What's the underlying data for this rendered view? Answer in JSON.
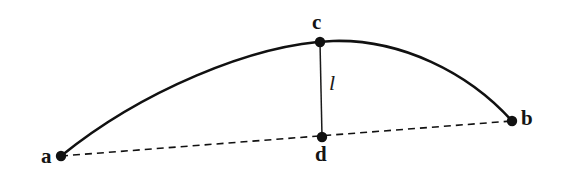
{
  "figure": {
    "background_color": "#ffffff",
    "stroke_color": "#111111",
    "arc_stroke_width": 2.6,
    "chord_stroke_width": 1.6,
    "sagitta_stroke_width": 1.5,
    "chord_dash_pattern": "7 5",
    "point_radius": 5.2
  },
  "points": [
    {
      "id": "a",
      "label": "a",
      "x": 61,
      "y": 156,
      "kind": "arc-endpoint"
    },
    {
      "id": "b",
      "label": "b",
      "x": 512,
      "y": 121,
      "kind": "arc-endpoint"
    },
    {
      "id": "c",
      "label": "c",
      "x": 320,
      "y": 42,
      "kind": "arc-apex"
    },
    {
      "id": "d",
      "label": "d",
      "x": 322,
      "y": 137,
      "kind": "chord-foot"
    }
  ],
  "segments": [
    {
      "id": "arc-ab",
      "from": "a",
      "to": "b",
      "style": "solid-curve",
      "label": null
    },
    {
      "id": "chord-ab",
      "from": "a",
      "to": "b",
      "style": "dashed-line",
      "label": null
    },
    {
      "id": "sagitta-cd",
      "from": "c",
      "to": "d",
      "style": "solid-thin-line",
      "label": "l"
    }
  ],
  "labels": {
    "a": "a",
    "b": "b",
    "c": "c",
    "d": "d",
    "l": "l"
  }
}
